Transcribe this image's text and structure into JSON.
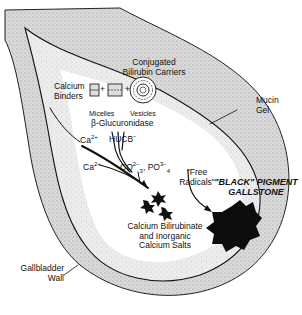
{
  "diagram": {
    "labels": {
      "conjugated_carriers_line1": "Conjugated",
      "conjugated_carriers_line2": "Bilirubin Carriers",
      "calcium_binders_line1": "Calcium",
      "calcium_binders_line2": "Binders",
      "micelles": "Micelles",
      "vesicles": "Vesicles",
      "beta_glucuronidase": "β-Glucuronidase",
      "ca_ion_1": "Ca",
      "ca_ion_1_charge": "2+",
      "hucb": "HUCB",
      "hucb_charge": "−",
      "ca_ion_2": "Ca",
      "ca_ion_2_charge": "2+",
      "carbonate": "CO",
      "carbonate_charge": "2−",
      "carbonate_sub": "3",
      "separator": ",",
      "phosphate": "PO",
      "phosphate_charge": "3−",
      "phosphate_sub": "4",
      "free_radicals_line1": "\"Free",
      "free_radicals_line2": "Radicals\"",
      "gallstone_line1": "\"BLACK\" PIGMENT",
      "gallstone_line2": "GALLSTONE",
      "precipitate_line1": "Calcium Bilirubinate",
      "precipitate_line2": "and Inorganic",
      "precipitate_line3": "Calcium Salts",
      "mucin_line1": "Mucin",
      "mucin_line2": "Gel",
      "wall_line1": "Gallbladder",
      "wall_line2": "Wall"
    },
    "symbols": {
      "plus_1": "+",
      "plus_2": "+"
    },
    "colors": {
      "wall_fill": "#cfcfcf",
      "mucin_fill": "#e4e4e4",
      "lumen_fill": "#ffffff",
      "stone_fill": "#0d0d0d",
      "line": "#111111"
    }
  }
}
